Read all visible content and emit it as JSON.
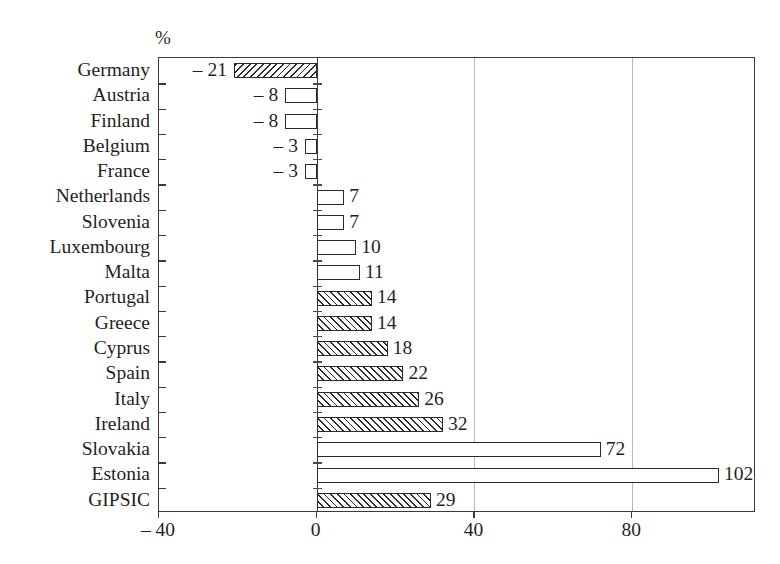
{
  "chart_data": {
    "type": "bar",
    "orientation": "horizontal",
    "title": "",
    "subtitle": "",
    "unit_label": "%",
    "xlabel": "",
    "ylabel": "",
    "xlim": [
      -40,
      111.4
    ],
    "grid": true,
    "grid_axis": "x",
    "legend": "none",
    "xticks": [
      -40,
      0,
      40,
      80
    ],
    "xtick_labels": [
      "– 40",
      "0",
      "40",
      "80"
    ],
    "categories": [
      "Germany",
      "Austria",
      "Finland",
      "Belgium",
      "France",
      "Netherlands",
      "Slovenia",
      "Luxembourg",
      "Malta",
      "Portugal",
      "Greece",
      "Cyprus",
      "Spain",
      "Italy",
      "Ireland",
      "Slovakia",
      "Estonia",
      "GIPSIC"
    ],
    "values": [
      -21,
      -8,
      -8,
      -3,
      -3,
      7,
      7,
      10,
      11,
      14,
      14,
      18,
      22,
      26,
      32,
      72,
      102,
      29
    ],
    "value_labels": [
      "– 21",
      "– 8",
      "– 8",
      "– 3",
      "– 3",
      "7",
      "7",
      "10",
      "11",
      "14",
      "14",
      "18",
      "22",
      "26",
      "32",
      "72",
      "102",
      "29"
    ],
    "bar_styles": [
      "hatched",
      "white",
      "white",
      "white",
      "white",
      "white",
      "white",
      "white",
      "white",
      "hatched",
      "hatched",
      "hatched",
      "hatched",
      "hatched",
      "hatched",
      "white",
      "white",
      "hatched"
    ],
    "colors": {
      "bar_edge": "#2a2a2a",
      "bar_fill": "#ffffff",
      "hatch": "#2a2a2a",
      "axis": "#3a3a3a",
      "grid": "#b8b8b8",
      "text": "#1f1f1f",
      "background": "#ffffff"
    }
  }
}
